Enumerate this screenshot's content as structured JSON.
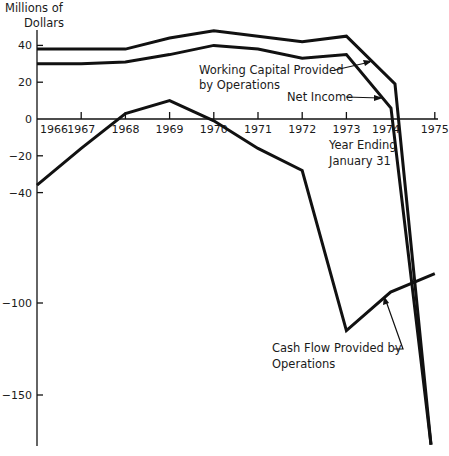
{
  "chart_data": {
    "type": "line",
    "title": "",
    "ylabel": "Millions of Dollars",
    "xlabel": "Year Ending January 31",
    "ylim": [
      -180,
      48
    ],
    "grid": false,
    "legend": "inline annotations",
    "x": [
      1966,
      1967,
      1968,
      1969,
      1970,
      1971,
      1972,
      1973,
      1974,
      1975
    ],
    "x_tick_labels": [
      "1966",
      "1967",
      "1968",
      "1969",
      "1970",
      "1971",
      "1972",
      "1973",
      "1974",
      "1975"
    ],
    "y_tick_labels": [
      "40",
      "20",
      "0",
      "-20",
      "-40",
      "-100",
      "-150"
    ],
    "y_ticks": [
      40,
      20,
      0,
      -20,
      -40,
      -100,
      -150
    ],
    "series": [
      {
        "name": "Working Capital Provided by Operations",
        "values": [
          38,
          38,
          38,
          44,
          48,
          45,
          42,
          45,
          19,
          -177
        ]
      },
      {
        "name": "Net Income",
        "values": [
          30,
          30,
          31,
          35,
          40,
          38,
          33,
          35,
          6,
          -177
        ]
      },
      {
        "name": "Cash Flow Provided by Operations",
        "values": [
          -36,
          -16,
          3,
          10,
          -1,
          -16,
          -28,
          -115,
          -94,
          -84
        ]
      }
    ],
    "annotations": [
      "Working Capital Provided by Operations",
      "Net Income",
      "Cash Flow Provided by Operations",
      "Year Ending January 31"
    ]
  },
  "labels": {
    "ylabel_line1": "Millions of",
    "ylabel_line2": "Dollars",
    "xlabel_line1": "Year Ending",
    "xlabel_line2": "January 31",
    "wc_line1": "Working Capital Provided",
    "wc_line2": "by Operations",
    "ni": "Net Income",
    "cf_line1": "Cash Flow Provided by",
    "cf_line2": "Operations"
  }
}
